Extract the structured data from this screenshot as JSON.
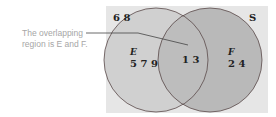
{
  "annotation": {
    "line1": "The overlapping",
    "line2": "region is E and F."
  },
  "venn": {
    "universe_label": "S",
    "outside_values": "6 8",
    "set_left": {
      "label": "E",
      "only_values": "5 7 9"
    },
    "set_right": {
      "label": "F",
      "only_values": "2 4"
    },
    "intersection_values": "1 3",
    "colors": {
      "universe": "#e6e6e6",
      "left_fill": "#d0d0d0",
      "right_fill": "#b9b9b9",
      "overlap_fill": "#bdbdbd",
      "outline": "#5a4a4a",
      "leader_line": "#444444"
    }
  }
}
